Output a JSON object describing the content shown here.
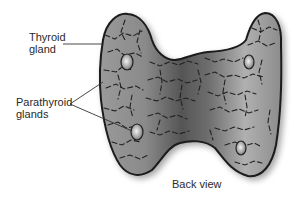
{
  "diagram": {
    "view_label": "Back view",
    "labels": [
      {
        "id": "thyroid",
        "text": "Thyroid\ngland"
      },
      {
        "id": "parathyroid",
        "text": "Parathyroid\nglands"
      }
    ],
    "parathyroid_count": 4,
    "colors": {
      "gland_fill_light": "#b9b9b9",
      "gland_fill_dark": "#5a5a5a",
      "outline": "#1a1a1a",
      "parathyroid_highlight": "#e8e8e8",
      "leader_line": "#333333"
    }
  }
}
